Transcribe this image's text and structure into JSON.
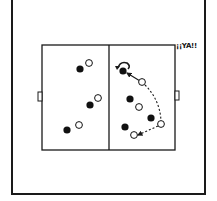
{
  "diagram": {
    "type": "sports-drill",
    "annotation": "¡¡YA!!",
    "colors": {
      "line": "#1a1a1a",
      "team_a": "#111111",
      "team_b": "#ffffff",
      "background": "#ffffff"
    },
    "field": {
      "x": 42,
      "y": 45,
      "width": 133,
      "height": 105,
      "midline_x": 109
    },
    "goals": [
      {
        "side": "left",
        "x": 38,
        "y": 92,
        "width": 4,
        "height": 9
      },
      {
        "side": "right",
        "x": 175,
        "y": 91,
        "width": 4,
        "height": 9
      }
    ],
    "players": [
      {
        "team": "black",
        "x": 80,
        "y": 69
      },
      {
        "team": "white",
        "x": 89,
        "y": 63
      },
      {
        "team": "black",
        "x": 90,
        "y": 105
      },
      {
        "team": "white",
        "x": 98,
        "y": 98
      },
      {
        "team": "black",
        "x": 67,
        "y": 130
      },
      {
        "team": "white",
        "x": 79,
        "y": 125
      },
      {
        "team": "black",
        "x": 123,
        "y": 71
      },
      {
        "team": "white",
        "x": 142,
        "y": 82
      },
      {
        "team": "black",
        "x": 130,
        "y": 99
      },
      {
        "team": "white",
        "x": 139,
        "y": 107
      },
      {
        "team": "black",
        "x": 151,
        "y": 118
      },
      {
        "team": "white",
        "x": 161,
        "y": 124
      },
      {
        "team": "black",
        "x": 125,
        "y": 127
      },
      {
        "team": "white",
        "x": 134,
        "y": 135
      }
    ]
  }
}
